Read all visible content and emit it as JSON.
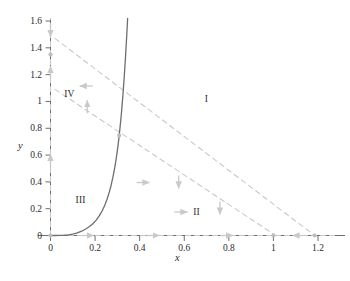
{
  "figure": {
    "caption": ""
  },
  "axes": {
    "xlabel": "x",
    "ylabel": "y",
    "xticks": [
      "0",
      "0.2",
      "0.4",
      "0.6",
      "0.8",
      "1",
      "1.2"
    ],
    "xtick_values": [
      0,
      0.2,
      0.4,
      0.6,
      0.8,
      1.0,
      1.2
    ],
    "yticks": [
      "0",
      "0.2",
      "0.4",
      "0.6",
      "0.8",
      "1",
      "1.2",
      "1.4",
      "1.6"
    ],
    "ytick_values": [
      0,
      0.2,
      0.4,
      0.6,
      0.8,
      1.0,
      1.2,
      1.4,
      1.6
    ]
  },
  "regions": [
    {
      "label": "I",
      "x": 0.7,
      "y": 1.02
    },
    {
      "label": "II",
      "x": 0.655,
      "y": 0.175
    },
    {
      "label": "III",
      "x": 0.135,
      "y": 0.265
    },
    {
      "label": "IV",
      "x": 0.085,
      "y": 1.055
    }
  ],
  "colors": {
    "axis": "#6e6e6e",
    "solid_curve": "#6e6e6e",
    "dashed_nullcline": "#c9c9c9",
    "arrow": "#c9c9c9",
    "equilibrium": "#bdbdbd",
    "text": "#2b2b2b"
  },
  "chart_data": {
    "type": "line",
    "title": "",
    "subtitle": "",
    "xlabel": "x",
    "ylabel": "y",
    "xlim": [
      -0.06,
      1.3
    ],
    "ylim": [
      -0.075,
      1.66
    ],
    "grid": false,
    "legend": null,
    "annotations": [
      {
        "text": "I",
        "x": 0.7,
        "y": 1.02,
        "note": "region label"
      },
      {
        "text": "II",
        "x": 0.655,
        "y": 0.175,
        "note": "region label"
      },
      {
        "text": "III",
        "x": 0.135,
        "y": 0.265,
        "note": "region label"
      },
      {
        "text": "IV",
        "x": 0.085,
        "y": 1.055,
        "note": "region label"
      }
    ],
    "series": [
      {
        "name": "solid-nullcline",
        "style": "solid",
        "color": "#6e6e6e",
        "points": [
          [
            0.0,
            0.0
          ],
          [
            0.02,
            0.0
          ],
          [
            0.04,
            0.001
          ],
          [
            0.06,
            0.002
          ],
          [
            0.08,
            0.005
          ],
          [
            0.1,
            0.01
          ],
          [
            0.12,
            0.019
          ],
          [
            0.14,
            0.032
          ],
          [
            0.16,
            0.05
          ],
          [
            0.175,
            0.067
          ],
          [
            0.19,
            0.088
          ],
          [
            0.205,
            0.115
          ],
          [
            0.22,
            0.15
          ],
          [
            0.232,
            0.185
          ],
          [
            0.244,
            0.228
          ],
          [
            0.254,
            0.272
          ],
          [
            0.264,
            0.325
          ],
          [
            0.272,
            0.375
          ],
          [
            0.28,
            0.435
          ],
          [
            0.288,
            0.505
          ],
          [
            0.294,
            0.565
          ],
          [
            0.3,
            0.635
          ],
          [
            0.305,
            0.7
          ],
          [
            0.31,
            0.775
          ],
          [
            0.314,
            0.84
          ],
          [
            0.318,
            0.91
          ],
          [
            0.321,
            0.97
          ],
          [
            0.325,
            1.05
          ],
          [
            0.328,
            1.12
          ],
          [
            0.331,
            1.19
          ],
          [
            0.334,
            1.265
          ],
          [
            0.337,
            1.345
          ],
          [
            0.339,
            1.405
          ],
          [
            0.342,
            1.49
          ],
          [
            0.344,
            1.555
          ],
          [
            0.346,
            1.62
          ]
        ]
      },
      {
        "name": "dashed-nullcline-upper",
        "style": "dashed",
        "color": "#c9c9c9",
        "points": [
          [
            0.02,
            1.47
          ],
          [
            1.185,
            0.0
          ]
        ]
      },
      {
        "name": "dashed-nullcline-lower",
        "style": "dashed",
        "color": "#c9c9c9",
        "points": [
          [
            0.02,
            1.09
          ],
          [
            1.01,
            0.0
          ]
        ]
      },
      {
        "name": "x-axis-trajectory",
        "style": "dashed",
        "color": "#c9c9c9",
        "points": [
          [
            0.0,
            0.0
          ],
          [
            1.285,
            0.0
          ]
        ]
      },
      {
        "name": "y-axis-trajectory",
        "style": "dashed",
        "color": "#c9c9c9",
        "points": [
          [
            0.0,
            0.0
          ],
          [
            0.0,
            1.62
          ]
        ]
      }
    ],
    "equilibria": [
      {
        "x": 0.0,
        "y": 0.0
      },
      {
        "x": 1.0,
        "y": 0.0
      },
      {
        "x": 1.185,
        "y": 0.0
      },
      {
        "x": 0.308,
        "y": 0.745
      },
      {
        "x": 0.0,
        "y": 1.35
      }
    ],
    "direction_arrows": [
      {
        "x": 0.0,
        "y": 1.53,
        "dir": "down"
      },
      {
        "x": 0.0,
        "y": 1.215,
        "dir": "up"
      },
      {
        "x": 0.0,
        "y": 0.56,
        "dir": "up"
      },
      {
        "x": 0.16,
        "y": 1.115,
        "dir": "left"
      },
      {
        "x": 0.165,
        "y": 0.96,
        "dir": "up"
      },
      {
        "x": 0.415,
        "y": 0.395,
        "dir": "right"
      },
      {
        "x": 0.575,
        "y": 0.4,
        "dir": "down"
      },
      {
        "x": 0.585,
        "y": 0.175,
        "dir": "right"
      },
      {
        "x": 0.76,
        "y": 0.205,
        "dir": "down"
      },
      {
        "x": 0.165,
        "y": 0.0,
        "dir": "right"
      },
      {
        "x": 0.46,
        "y": 0.0,
        "dir": "right"
      },
      {
        "x": 0.79,
        "y": 0.0,
        "dir": "right"
      },
      {
        "x": 1.115,
        "y": 0.0,
        "dir": "left"
      }
    ]
  }
}
